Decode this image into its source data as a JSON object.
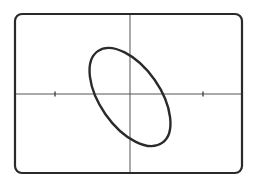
{
  "figure": {
    "frame": {
      "x": 15,
      "y": 14,
      "width": 227,
      "height": 159,
      "corner_radius": 7,
      "stroke": "#2a2a2a",
      "stroke_width": 2.2
    },
    "axes": {
      "origin": {
        "x": 130,
        "y": 94
      },
      "stroke": "#555555",
      "stroke_width": 1,
      "x_ticks": [
        55,
        203
      ]
    },
    "ellipse": {
      "cx": 130,
      "cy": 97,
      "rx": 56,
      "ry": 30,
      "rotation_deg": 55,
      "stroke": "#2a2a2a",
      "stroke_width": 2.4
    }
  }
}
